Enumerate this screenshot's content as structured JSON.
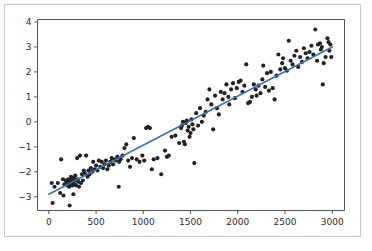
{
  "figure": {
    "background_color": "#ffffff",
    "border_color": "#c8c8c8",
    "width": 372,
    "height": 251
  },
  "chart_data": {
    "type": "scatter",
    "title": "",
    "subtitle": "",
    "xlabel": "",
    "ylabel": "",
    "grid": false,
    "legend": null,
    "point_color": "#222222",
    "line_color": "#3c6fb4",
    "xlim": [
      -120,
      3130
    ],
    "ylim": [
      -3.55,
      4.1
    ],
    "xticks": [
      0,
      500,
      1000,
      1500,
      2000,
      2500,
      3000
    ],
    "xtick_labels": [
      "0",
      "500",
      "1000",
      "1500",
      "2000",
      "2500",
      "3000"
    ],
    "yticks": [
      -3,
      -2,
      -1,
      0,
      1,
      2,
      3,
      4
    ],
    "ytick_labels": [
      "−3",
      "−2",
      "−1",
      "0",
      "1",
      "2",
      "3",
      "4"
    ],
    "series": [
      {
        "name": "observations",
        "marker": "circle",
        "marker_size": 3,
        "x": [
          30,
          40,
          60,
          95,
          120,
          130,
          150,
          155,
          165,
          180,
          190,
          200,
          205,
          210,
          215,
          220,
          225,
          230,
          235,
          240,
          245,
          250,
          255,
          260,
          265,
          270,
          275,
          280,
          290,
          300,
          305,
          310,
          320,
          330,
          340,
          350,
          360,
          370,
          380,
          395,
          410,
          420,
          430,
          445,
          460,
          470,
          485,
          500,
          515,
          530,
          545,
          560,
          575,
          590,
          605,
          620,
          635,
          650,
          665,
          680,
          695,
          710,
          725,
          740,
          745,
          760,
          780,
          800,
          820,
          840,
          860,
          880,
          900,
          930,
          960,
          990,
          1010,
          1030,
          1050,
          1070,
          1090,
          1110,
          1150,
          1190,
          1230,
          1250,
          1270,
          1300,
          1340,
          1380,
          1400,
          1410,
          1420,
          1430,
          1440,
          1450,
          1460,
          1470,
          1480,
          1490,
          1500,
          1510,
          1520,
          1530,
          1540,
          1560,
          1580,
          1600,
          1620,
          1640,
          1660,
          1680,
          1700,
          1720,
          1740,
          1760,
          1780,
          1800,
          1820,
          1840,
          1860,
          1880,
          1900,
          1910,
          1930,
          1950,
          1970,
          1990,
          2010,
          2030,
          2050,
          2070,
          2090,
          2110,
          2130,
          2150,
          2170,
          2190,
          2200,
          2220,
          2240,
          2260,
          2270,
          2290,
          2310,
          2330,
          2350,
          2370,
          2390,
          2410,
          2430,
          2450,
          2470,
          2480,
          2500,
          2520,
          2540,
          2560,
          2580,
          2600,
          2620,
          2640,
          2660,
          2680,
          2700,
          2720,
          2740,
          2760,
          2780,
          2800,
          2820,
          2840,
          2850,
          2870,
          2880,
          2890,
          2900,
          2910,
          2930,
          2950,
          2960,
          2970,
          2980,
          2990
        ],
        "y": [
          -2.45,
          -3.25,
          -2.6,
          -2.45,
          -2.85,
          -1.5,
          -2.3,
          -2.95,
          -2.5,
          -2.35,
          -2.4,
          -2.55,
          -2.3,
          -2.45,
          -2.6,
          -3.35,
          -2.35,
          -2.5,
          -2.2,
          -2.4,
          -2.3,
          -2.55,
          -2.45,
          -2.9,
          -2.25,
          -2.35,
          -2.5,
          -2.15,
          -2.55,
          -1.45,
          -2.3,
          -2.4,
          -2.6,
          -1.35,
          -2.45,
          -2.1,
          -2.35,
          -1.95,
          -2.05,
          -1.35,
          -2.2,
          -1.95,
          -2.1,
          -1.85,
          -2.0,
          -1.6,
          -1.9,
          -1.75,
          -1.95,
          -1.55,
          -1.8,
          -1.6,
          -1.85,
          -1.7,
          -1.55,
          -1.9,
          -1.75,
          -1.6,
          -1.45,
          -1.7,
          -1.5,
          -1.55,
          -1.4,
          -2.6,
          -1.6,
          -1.5,
          -1.35,
          -1.05,
          -0.9,
          -1.55,
          -1.8,
          -1.45,
          -0.65,
          -1.5,
          -1.6,
          -1.35,
          -1.55,
          -0.25,
          -0.2,
          -0.25,
          -1.9,
          -1.5,
          -1.45,
          -2.1,
          -1.15,
          -1.4,
          -1.35,
          -0.6,
          -0.55,
          -0.85,
          -0.25,
          -0.15,
          0.0,
          -0.8,
          -0.9,
          -0.05,
          0.05,
          -0.35,
          -0.2,
          -0.6,
          -0.45,
          0.1,
          -0.1,
          -0.3,
          -1.65,
          0.35,
          -0.15,
          0.55,
          0.0,
          0.25,
          0.4,
          0.9,
          1.3,
          0.7,
          -0.3,
          1.05,
          0.55,
          0.3,
          1.2,
          0.9,
          1.15,
          1.5,
          1.0,
          0.7,
          1.3,
          1.55,
          0.95,
          1.35,
          1.6,
          1.65,
          1.2,
          1.45,
          2.3,
          0.75,
          0.8,
          1.0,
          1.5,
          1.3,
          1.05,
          1.45,
          1.15,
          1.7,
          2.25,
          1.4,
          1.95,
          1.25,
          2.0,
          1.35,
          0.9,
          1.85,
          2.7,
          2.1,
          2.35,
          2.55,
          2.15,
          2.05,
          3.25,
          2.45,
          2.3,
          2.65,
          2.85,
          2.2,
          2.6,
          2.4,
          2.95,
          2.75,
          2.55,
          2.8,
          3.05,
          2.7,
          3.7,
          2.45,
          3.1,
          3.15,
          2.9,
          3.0,
          1.5,
          2.35,
          2.6,
          3.35,
          3.2,
          2.85,
          3.1,
          2.6
        ]
      }
    ],
    "fit_line": {
      "name": "linear-regression-fit",
      "x_start": 0,
      "x_end": 3000,
      "y_start": -2.9,
      "y_end": 3.0,
      "slope": 0.001967,
      "intercept": -2.9
    }
  }
}
